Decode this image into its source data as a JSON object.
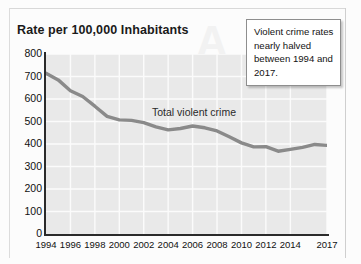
{
  "chart_title": "Rate per 100,000 Inhabitants",
  "series_label": "Total violent crime",
  "callout": {
    "text": "Violent crime rates nearly halved between 1994 and 2017."
  },
  "ghost_letter": "A",
  "axis": {
    "y_ticks": [
      "800",
      "700",
      "600",
      "500",
      "400",
      "300",
      "200",
      "100",
      "0"
    ],
    "x_ticks": [
      "1994",
      "1996",
      "1998",
      "2000",
      "2002",
      "2004",
      "2006",
      "2008",
      "2010",
      "2012",
      "2014",
      "2017"
    ]
  },
  "colors": {
    "line": "#8a8a8a",
    "plot_background": "#e9e9e9",
    "gridline": "#fbfbfb",
    "axis": "#2b2b2b",
    "callout_border": "#8e8e8e"
  },
  "chart_data": {
    "type": "line",
    "title": "Rate per 100,000 Inhabitants",
    "xlabel": "",
    "ylabel": "Rate per 100,000 Inhabitants",
    "ylim": [
      0,
      800
    ],
    "xlim": [
      1994,
      2017
    ],
    "grid": true,
    "legend": "inline-label",
    "annotations": [
      "Violent crime rates nearly halved between 1994 and 2017."
    ],
    "x": [
      1994,
      1995,
      1996,
      1997,
      1998,
      1999,
      2000,
      2001,
      2002,
      2003,
      2004,
      2005,
      2006,
      2007,
      2008,
      2009,
      2010,
      2011,
      2012,
      2013,
      2014,
      2015,
      2016,
      2017
    ],
    "series": [
      {
        "name": "Total violent crime",
        "values": [
          714,
          685,
          637,
          611,
          568,
          523,
          507,
          505,
          495,
          476,
          463,
          469,
          480,
          472,
          458,
          432,
          405,
          387,
          388,
          368,
          376,
          385,
          398,
          394
        ]
      }
    ],
    "x_tick_labels": [
      "1994",
      "1996",
      "1998",
      "2000",
      "2002",
      "2004",
      "2006",
      "2008",
      "2010",
      "2012",
      "2014",
      "2017"
    ],
    "y_tick_labels": [
      "0",
      "100",
      "200",
      "300",
      "400",
      "500",
      "600",
      "700",
      "800"
    ]
  }
}
